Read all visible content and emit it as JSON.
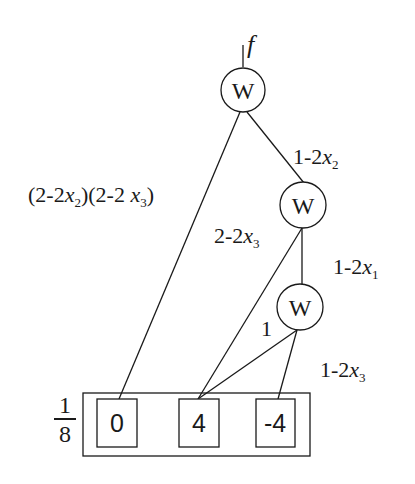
{
  "diagram": {
    "output": {
      "label": "f"
    },
    "nodes": [
      {
        "id": "w-top",
        "label": "W"
      },
      {
        "id": "w-middle",
        "label": "W"
      },
      {
        "id": "w-bottom",
        "label": "W"
      }
    ],
    "terminals": {
      "scale": {
        "numerator": "1",
        "denominator": "8"
      },
      "values": [
        "0",
        "4",
        "-4"
      ]
    },
    "edges": [
      {
        "from": "w-top",
        "to": "terminal-0",
        "label": {
          "text": "(2-2",
          "var": "x",
          "sub": "2",
          "text2": ")(2-2 ",
          "var2": "x",
          "sub2": "3",
          "text3": ")"
        }
      },
      {
        "from": "w-top",
        "to": "w-middle",
        "label": {
          "text": "1-2",
          "var": "x",
          "sub": "2"
        }
      },
      {
        "from": "w-middle",
        "to": "terminal-4",
        "label": {
          "text": "2-2",
          "var": "x",
          "sub": "3"
        }
      },
      {
        "from": "w-middle",
        "to": "w-bottom",
        "label": {
          "text": "1-2",
          "var": "x",
          "sub": "1"
        }
      },
      {
        "from": "w-bottom",
        "to": "terminal-4",
        "label": {
          "text": "1"
        }
      },
      {
        "from": "w-bottom",
        "to": "terminal-neg4",
        "label": {
          "text": "1-2",
          "var": "x",
          "sub": "3"
        }
      }
    ]
  }
}
